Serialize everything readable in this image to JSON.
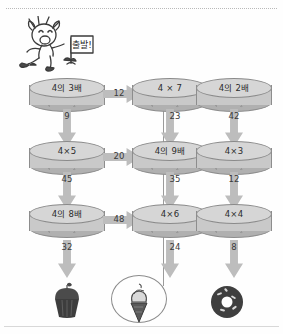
{
  "worksheet": {
    "mascot": {
      "name": "running-boy-with-flag",
      "flag_text": "출발!"
    },
    "nodes": [
      {
        "id": "r1c1",
        "label": "4의 3배"
      },
      {
        "id": "r1c2",
        "label": "4 × 7"
      },
      {
        "id": "r1c3",
        "label": "4의 2배"
      },
      {
        "id": "r2c1",
        "label": "4×5"
      },
      {
        "id": "r2c2",
        "label": "4의 9배"
      },
      {
        "id": "r2c3",
        "label": "4×3"
      },
      {
        "id": "r3c1",
        "label": "4의 8배"
      },
      {
        "id": "r3c2",
        "label": "4×6"
      },
      {
        "id": "r3c3",
        "label": "4×4"
      }
    ],
    "arrows_right": [
      {
        "id": "r1-a1",
        "value": "12"
      },
      {
        "id": "r1-a2",
        "value": "18"
      },
      {
        "id": "r2-a1",
        "value": "20"
      },
      {
        "id": "r2-a2",
        "value": "26"
      },
      {
        "id": "r3-a1",
        "value": "48"
      },
      {
        "id": "r3-a2",
        "value": "12"
      }
    ],
    "arrows_down": [
      {
        "id": "c1-d1",
        "value": "9"
      },
      {
        "id": "c2-d1",
        "value": "23"
      },
      {
        "id": "c3-d1",
        "value": "42"
      },
      {
        "id": "c1-d2",
        "value": "45"
      },
      {
        "id": "c2-d2",
        "value": "35"
      },
      {
        "id": "c3-d2",
        "value": "12"
      },
      {
        "id": "c1-d3",
        "value": "32"
      },
      {
        "id": "c2-d3",
        "value": "24"
      },
      {
        "id": "c3-d3",
        "value": "8"
      }
    ],
    "desserts": [
      {
        "id": "d1",
        "name": "cupcake",
        "selected": false
      },
      {
        "id": "d2",
        "name": "ice-cream-cone",
        "selected": true
      },
      {
        "id": "d3",
        "name": "donut",
        "selected": false
      }
    ],
    "colors": {
      "cylinder_top": "#d6d6d6",
      "cylinder_body": "#c9c9c9",
      "arrow": "#bdbdbd",
      "text": "#2b2b2b",
      "ink": "#3a3a3a"
    }
  }
}
